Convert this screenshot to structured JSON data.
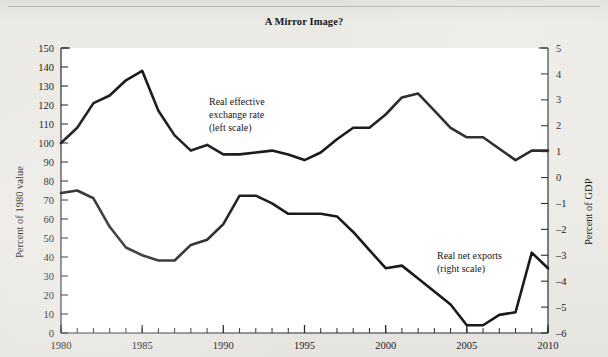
{
  "figure": {
    "title": "A Mirror Image?",
    "background_color": "#ece9e4",
    "line_color": "#1a1a1d"
  },
  "annotations": {
    "left_series_line1": "Real effective",
    "left_series_line2": "exchange rate",
    "left_series_line3": "(left scale)",
    "right_series_line1": "Real net exports",
    "right_series_line2": "(right scale)"
  },
  "chart_data": {
    "type": "line",
    "title": "A Mirror Image?",
    "xlabel": "",
    "ylabel": "Percent of 1980 value",
    "y2label": "Percent of GDP",
    "grid": false,
    "legend_position": "inline-annotations",
    "xlim": [
      1980,
      2010
    ],
    "ylim": [
      0,
      150
    ],
    "y2lim": [
      -6,
      5
    ],
    "xticks": [
      1980,
      1985,
      1990,
      1995,
      2000,
      2005,
      2010
    ],
    "xtick_labels": [
      "1980",
      "1985",
      "1990",
      "1995",
      "2000",
      "2005",
      "2010"
    ],
    "x_minor_tick_step": 1,
    "yticks": [
      0,
      10,
      20,
      30,
      40,
      50,
      60,
      70,
      80,
      90,
      100,
      110,
      120,
      130,
      140,
      150
    ],
    "ytick_labels": [
      "0",
      "10",
      "20",
      "30",
      "40",
      "50",
      "60",
      "70",
      "80",
      "90",
      "100",
      "110",
      "120",
      "130",
      "140",
      "150"
    ],
    "y2ticks": [
      -6,
      -5,
      -4,
      -3,
      -2,
      -1,
      0,
      1,
      2,
      3,
      4,
      5
    ],
    "y2tick_labels": [
      "–6",
      "–5",
      "–4",
      "–3",
      "–2",
      "–1",
      "0",
      "1",
      "2",
      "3",
      "4",
      "5"
    ],
    "x": [
      1980,
      1981,
      1982,
      1983,
      1984,
      1985,
      1986,
      1987,
      1988,
      1989,
      1990,
      1991,
      1992,
      1993,
      1994,
      1995,
      1996,
      1997,
      1998,
      1999,
      2000,
      2001,
      2002,
      2003,
      2004,
      2005,
      2006,
      2007,
      2008,
      2009,
      2010
    ],
    "series": [
      {
        "name": "Real effective exchange rate (left scale)",
        "axis": "left",
        "units": "Percent of 1980 value",
        "values": [
          100,
          108,
          121,
          125,
          133,
          138,
          117,
          104,
          96,
          99,
          94,
          94,
          95,
          96,
          94,
          91,
          95,
          102,
          108,
          108,
          115,
          124,
          126,
          117,
          108,
          103,
          103,
          97,
          91,
          96,
          96
        ]
      },
      {
        "name": "Real net exports (right scale)",
        "axis": "right",
        "units": "Percent of GDP",
        "values": [
          -0.6,
          -0.5,
          -0.8,
          -1.9,
          -2.7,
          -3.0,
          -3.2,
          -3.2,
          -2.6,
          -2.4,
          -1.8,
          -0.7,
          -0.7,
          -1.0,
          -1.4,
          -1.4,
          -1.4,
          -1.5,
          -2.1,
          -2.8,
          -3.5,
          -3.4,
          -3.9,
          -4.4,
          -4.9,
          -5.7,
          -5.7,
          -5.3,
          -5.2,
          -2.9,
          -3.5
        ]
      }
    ]
  }
}
